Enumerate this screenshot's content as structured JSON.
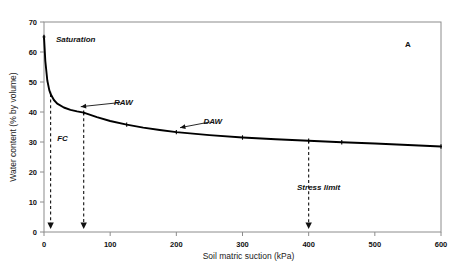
{
  "chart_data": {
    "type": "line",
    "title": "",
    "panel_label": "A",
    "xlabel": "Soil matric suction (kPa)",
    "ylabel": "Water content (% by volume)",
    "xlim": [
      0,
      600
    ],
    "ylim": [
      0,
      70
    ],
    "xticks": [
      0,
      100,
      200,
      300,
      400,
      500,
      600
    ],
    "yticks": [
      0,
      10,
      20,
      30,
      40,
      50,
      60,
      70
    ],
    "xtick_labels": [
      "0",
      "100",
      "200",
      "300",
      "400",
      "500",
      "600"
    ],
    "ytick_labels": [
      "0",
      "10",
      "20",
      "30",
      "40",
      "50",
      "60",
      "70"
    ],
    "grid": false,
    "legend": "none",
    "series": [
      {
        "name": "Soil water retention curve",
        "x": [
          0,
          2,
          5,
          8,
          10,
          15,
          20,
          30,
          40,
          50,
          60,
          80,
          100,
          125,
          150,
          175,
          200,
          250,
          300,
          350,
          400,
          450,
          500,
          550,
          600
        ],
        "y": [
          65.0,
          57.0,
          50.5,
          47.3,
          46.0,
          44.0,
          42.8,
          41.5,
          40.7,
          40.2,
          39.8,
          38.3,
          37.0,
          35.8,
          34.8,
          34.0,
          33.3,
          32.3,
          31.5,
          30.9,
          30.4,
          29.9,
          29.5,
          29.0,
          28.5
        ],
        "markers_x": [
          0,
          10,
          60,
          125,
          200,
          300,
          400,
          450,
          600
        ],
        "markers_y": [
          65.0,
          46.0,
          39.8,
          35.8,
          33.3,
          31.5,
          30.4,
          29.9,
          28.5
        ]
      }
    ],
    "annotations": [
      {
        "name": "saturation",
        "text": "Saturation",
        "x": 18,
        "y": 64.5,
        "kind": "point-label"
      },
      {
        "name": "raw",
        "text": "RAW",
        "x": 120,
        "y": 43.5,
        "kind": "arrow-label",
        "target_x": 48,
        "target_y": 40.6
      },
      {
        "name": "daw",
        "text": "DAW",
        "x": 255,
        "y": 37.0,
        "kind": "arrow-label",
        "target_x": 198,
        "target_y": 33.6
      },
      {
        "name": "fc",
        "text": "FC",
        "x": 20,
        "y": 31.5,
        "kind": "text"
      },
      {
        "name": "stress-limit",
        "text": "Stress limit",
        "x": 415,
        "y": 15.0,
        "kind": "text"
      }
    ],
    "dropline_arrows": [
      {
        "name": "fc-dropline",
        "x": 10,
        "y_top": 46.0,
        "y_bottom": 1.5
      },
      {
        "name": "raw-limit-dropline",
        "x": 60,
        "y_top": 39.8,
        "y_bottom": 1.5
      },
      {
        "name": "stress-limit-dropline",
        "x": 400,
        "y_top": 30.4,
        "y_bottom": 1.5
      }
    ],
    "colors": {
      "curve": "#000000",
      "axis": "#8c8c8c",
      "text": "#111111",
      "dashed": "#111111",
      "background": "#ffffff"
    }
  }
}
